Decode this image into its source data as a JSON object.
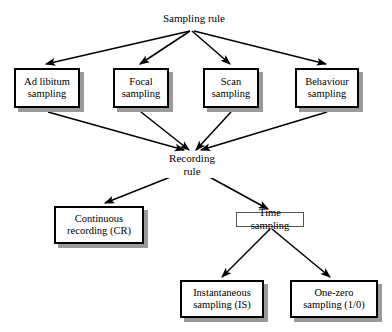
{
  "diagram": {
    "type": "flowchart",
    "title": "Sampling rule",
    "background": "#ffffff",
    "line_color": "#000000",
    "shadow_color": "#9a9a9a",
    "nodes": {
      "sampling_rule": {
        "label": "Sampling rule",
        "style": "plain"
      },
      "ad_libitum": {
        "label": "Ad libitum\nsampling",
        "style": "boxed"
      },
      "focal": {
        "label": "Focal\nsampling",
        "style": "boxed"
      },
      "scan": {
        "label": "Scan\nsampling",
        "style": "boxed"
      },
      "behaviour": {
        "label": "Behaviour\nsampling",
        "style": "boxed"
      },
      "recording_rule": {
        "label": "Recording\nrule",
        "style": "plain"
      },
      "continuous": {
        "label": "Continuous\nrecording (CR)",
        "style": "boxed"
      },
      "time_sampling": {
        "label": "Time sampling",
        "style": "thin"
      },
      "instantaneous": {
        "label": "Instantaneous\nsampling (IS)",
        "style": "boxed"
      },
      "one_zero": {
        "label": "One-zero\nsampling (1/0)",
        "style": "boxed"
      }
    },
    "edges": [
      {
        "from": "sampling_rule",
        "to": "ad_libitum"
      },
      {
        "from": "sampling_rule",
        "to": "focal"
      },
      {
        "from": "sampling_rule",
        "to": "scan"
      },
      {
        "from": "sampling_rule",
        "to": "behaviour"
      },
      {
        "from": "ad_libitum",
        "to": "recording_rule"
      },
      {
        "from": "focal",
        "to": "recording_rule"
      },
      {
        "from": "scan",
        "to": "recording_rule"
      },
      {
        "from": "behaviour",
        "to": "recording_rule"
      },
      {
        "from": "recording_rule",
        "to": "continuous"
      },
      {
        "from": "recording_rule",
        "to": "time_sampling"
      },
      {
        "from": "time_sampling",
        "to": "instantaneous"
      },
      {
        "from": "time_sampling",
        "to": "one_zero"
      }
    ]
  }
}
